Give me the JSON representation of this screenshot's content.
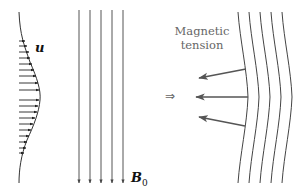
{
  "diagram": {
    "velocity_profile": {
      "label": "u",
      "description": "Horizontal velocity arrows with Gaussian-like envelope",
      "color": "#222222"
    },
    "uniform_field": {
      "label_main": "B",
      "label_sub": "0",
      "line_count": 5,
      "color": "#555555"
    },
    "bent_field": {
      "line_count": 5,
      "color": "#444444"
    },
    "tension": {
      "line1": "Magnetic",
      "line2": "tension",
      "arrow_count": 3,
      "arrow_color": "#555555"
    },
    "implies_symbol": "⇒"
  }
}
